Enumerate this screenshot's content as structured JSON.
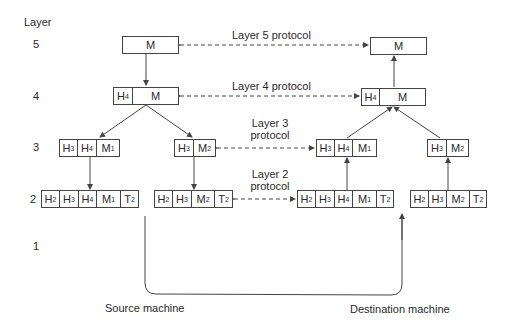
{
  "diagram": {
    "axis_title": "Layer",
    "layers": [
      "5",
      "4",
      "3",
      "2",
      "1"
    ],
    "protocols": {
      "layer5": "Layer 5 protocol",
      "layer4": "Layer 4 protocol",
      "layer3_line1": "Layer 3",
      "layer3_line2": "protocol",
      "layer2_line1": "Layer 2",
      "layer2_line2": "protocol"
    },
    "machines": {
      "source": "Source machine",
      "destination": "Destination machine"
    },
    "cells": {
      "M": "M",
      "H": "H",
      "T": "T",
      "M_sub": "M"
    },
    "subscripts": {
      "one": "1",
      "two": "2",
      "three": "3",
      "four": "4"
    },
    "colors": {
      "line": "#444444",
      "text": "#2a2a2a",
      "background": "#ffffff"
    }
  }
}
